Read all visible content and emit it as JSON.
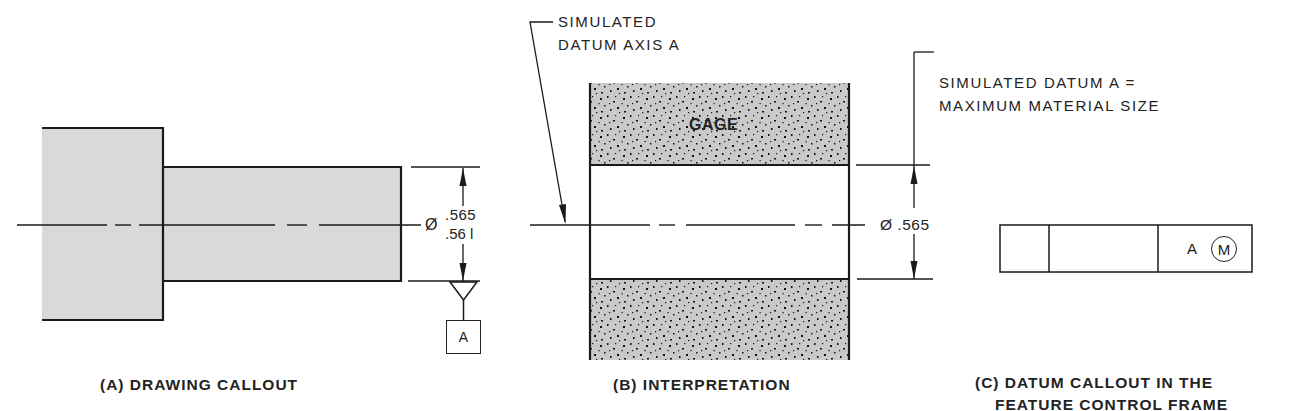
{
  "figure": {
    "panels": [
      {
        "id": "A",
        "caption": "(A) DRAWING CALLOUT",
        "diameter_symbol": "Ø",
        "tolerance_upper": ".565",
        "tolerance_lower": ".56 l",
        "datum_feature_label": "A"
      },
      {
        "id": "B",
        "caption": "(B) INTERPRETATION",
        "leader_note_line1": "SIMULATED",
        "leader_note_line2": "DATUM AXIS A",
        "gage_label": "GAGE",
        "dimension": "Ø .565",
        "size_note_line1": "SIMULATED DATUM A =",
        "size_note_line2": "MAXIMUM MATERIAL SIZE"
      },
      {
        "id": "C",
        "caption_line1": "(C) DATUM CALLOUT IN THE",
        "caption_line2": "FEATURE CONTROL FRAME",
        "frame": {
          "cells": [
            "",
            "",
            "A"
          ],
          "datum_reference": "A",
          "material_modifier": "M"
        }
      }
    ],
    "colors": {
      "line": "#1a1a1a",
      "part_fill": "#d9d9d9",
      "gage_fill": "#c8c8c8",
      "background": "#ffffff"
    }
  }
}
